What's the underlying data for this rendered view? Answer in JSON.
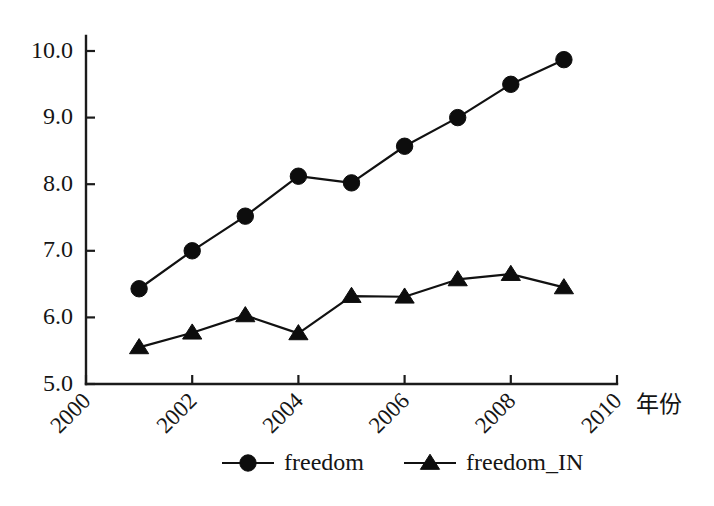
{
  "chart_data": {
    "type": "line",
    "title": "",
    "subtitle": "",
    "xlabel": "年份",
    "ylabel": "",
    "x": [
      2001,
      2002,
      2003,
      2004,
      2005,
      2006,
      2007,
      2008,
      2009
    ],
    "xlim": [
      2000,
      2010
    ],
    "ylim": [
      5.0,
      10.0
    ],
    "xticks": [
      2000,
      2002,
      2004,
      2006,
      2008,
      2010
    ],
    "xtick_labels": [
      "2000",
      "2002",
      "2004",
      "2006",
      "2008",
      "2010"
    ],
    "yticks": [
      5.0,
      6.0,
      7.0,
      8.0,
      9.0,
      10.0
    ],
    "ytick_labels": [
      "5.0",
      "6.0",
      "7.0",
      "8.0",
      "9.0",
      "10.0"
    ],
    "grid": false,
    "legend_position": "bottom-center",
    "series": [
      {
        "name": "freedom",
        "marker": "circle",
        "color": "#0d0d0d",
        "values": [
          6.43,
          7.0,
          7.52,
          8.12,
          8.02,
          8.57,
          9.0,
          9.5,
          9.87
        ]
      },
      {
        "name": "freedom_IN",
        "marker": "triangle",
        "color": "#0d0d0d",
        "values": [
          5.55,
          5.77,
          6.03,
          5.76,
          6.32,
          6.31,
          6.57,
          6.65,
          6.45
        ]
      }
    ]
  },
  "legend": {
    "items": [
      {
        "label": "freedom",
        "marker": "circle-marker"
      },
      {
        "label": "freedom_IN",
        "marker": "triangle-marker"
      }
    ]
  },
  "axis": {
    "x_title": "年份",
    "y_title": ""
  }
}
